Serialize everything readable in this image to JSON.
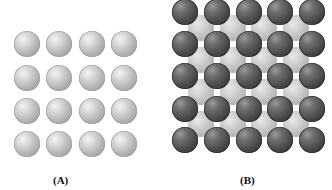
{
  "figure": {
    "panel_a": {
      "label": "(A)",
      "description": "Simple square lattice of identical light spheres",
      "rows": 4,
      "cols": 4,
      "sphere_color": "#b8b8b8",
      "x_centers": [
        27,
        59,
        92,
        124
      ],
      "y_centers": [
        44,
        78,
        111,
        144
      ],
      "diameter": 26
    },
    "panel_b": {
      "label": "(B)",
      "description": "Two interpenetrating square lattices: dark spheres with light spheres in the hollows",
      "dark": {
        "rows": 5,
        "cols": 5,
        "color": "#4a4a4a",
        "x_centers": [
          185,
          217,
          249,
          280,
          312
        ],
        "y_centers": [
          12,
          44,
          76,
          109,
          140
        ],
        "diameter": 26
      },
      "light": {
        "rows": 4,
        "cols": 4,
        "color": "#c4c4c4",
        "x_centers": [
          201,
          233,
          264,
          296
        ],
        "y_centers": [
          28,
          60,
          92,
          124
        ],
        "diameter": 26
      }
    }
  }
}
